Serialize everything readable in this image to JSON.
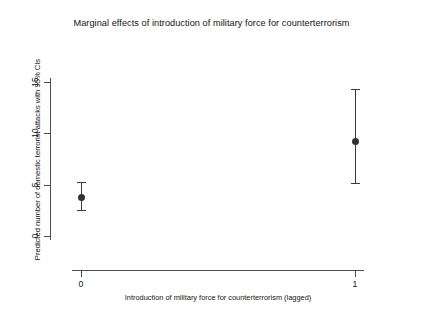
{
  "chart_data": {
    "type": "scatter",
    "title": "Marginal effects of introduction of military force for counterterrorism",
    "xlabel": "Introduction of military force for counterterrorism (lagged)",
    "ylabel": "Predicted number of domestic terrorist attacks with 95% CIs",
    "categories": [
      "0",
      "1"
    ],
    "x": [
      0,
      1
    ],
    "values": [
      3.8,
      9.3
    ],
    "error_low": [
      2.5,
      5.2
    ],
    "error_high": [
      5.3,
      14.3
    ],
    "yticks": [
      0,
      5,
      10,
      15
    ],
    "ytick_labels": [
      "0",
      "5",
      "10",
      "15"
    ],
    "xtick_labels": [
      "0",
      "1"
    ],
    "ylim": [
      -2.5,
      17.5
    ],
    "xlim": [
      -0.18,
      1.18
    ],
    "grid": false,
    "legend": null,
    "point_color": "#333333",
    "errorbar_color": "#3a3a3a",
    "axis_color": "#4d4d4d",
    "background_color": "#ffffff",
    "series": [
      {
        "name": "Predicted count with 95% CI",
        "points": [
          {
            "x_label": "0",
            "estimate": 3.8,
            "ci_low": 2.5,
            "ci_high": 5.3
          },
          {
            "x_label": "1",
            "estimate": 9.3,
            "ci_low": 5.2,
            "ci_high": 14.3
          }
        ]
      }
    ]
  }
}
